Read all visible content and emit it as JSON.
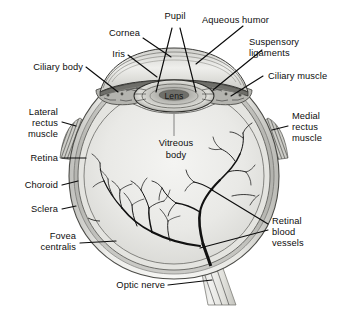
{
  "figure": {
    "type": "anatomical-illustration",
    "background_color": "#ffffff",
    "ink_color": "#0d0d0d"
  },
  "labels": {
    "pupil": "Pupil",
    "aqueous_humor": "Aqueous humor",
    "cornea": "Cornea",
    "suspensory_ligaments_l1": "Suspensory",
    "suspensory_ligaments_l2": "ligaments",
    "iris": "Iris",
    "ciliary_body": "Ciliary body",
    "ciliary_muscle": "Ciliary muscle",
    "lateral_rectus_l1": "Lateral",
    "lateral_rectus_l2": "rectus",
    "lateral_rectus_l3": "muscle",
    "medial_rectus_l1": "Medial",
    "medial_rectus_l2": "rectus",
    "medial_rectus_l3": "muscle",
    "retina": "Retina",
    "choroid": "Choroid",
    "sclera": "Sclera",
    "fovea_l1": "Fovea",
    "fovea_l2": "centralis",
    "retinal_vessels_l1": "Retinal",
    "retinal_vessels_l2": "blood",
    "retinal_vessels_l3": "vessels",
    "optic_nerve": "Optic nerve",
    "lens": "Lens",
    "vitreous_l1": "Vitreous",
    "vitreous_l2": "body"
  },
  "structures": [
    {
      "name": "cornea",
      "region": "anterior-transparent-dome"
    },
    {
      "name": "aqueous-humor",
      "region": "anterior-chamber"
    },
    {
      "name": "iris",
      "region": "pigmented-diaphragm"
    },
    {
      "name": "pupil",
      "region": "central-aperture"
    },
    {
      "name": "lens",
      "region": "biconvex-crystalline"
    },
    {
      "name": "suspensory-ligaments",
      "region": "zonular-fibers"
    },
    {
      "name": "ciliary-body",
      "region": "anterior-uvea"
    },
    {
      "name": "ciliary-muscle",
      "region": "accommodation-muscle"
    },
    {
      "name": "vitreous-body",
      "region": "posterior-cavity"
    },
    {
      "name": "retina",
      "region": "inner-tunic"
    },
    {
      "name": "choroid",
      "region": "middle-tunic"
    },
    {
      "name": "sclera",
      "region": "outer-tunic"
    },
    {
      "name": "fovea-centralis",
      "region": "macular-pit"
    },
    {
      "name": "optic-nerve",
      "region": "cranial-nerve-II"
    },
    {
      "name": "retinal-blood-vessels",
      "region": "central-retinal-artery-vein"
    },
    {
      "name": "lateral-rectus-muscle",
      "region": "extraocular-muscle"
    },
    {
      "name": "medial-rectus-muscle",
      "region": "extraocular-muscle"
    }
  ]
}
